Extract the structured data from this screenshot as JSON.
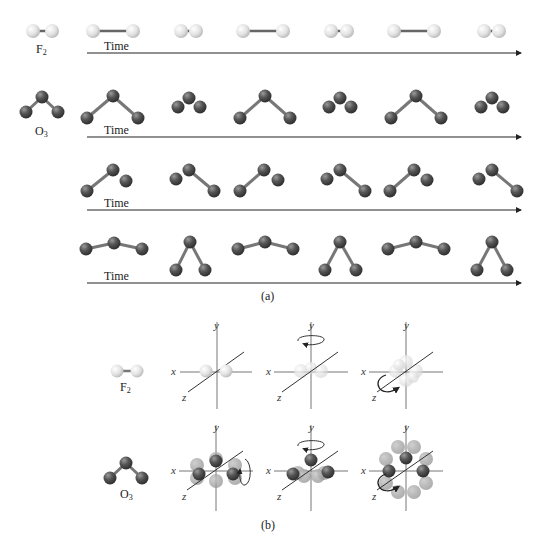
{
  "panel_a": {
    "caption": "(a)",
    "time_label": "Time",
    "rows": [
      {
        "id": "f2-vibration",
        "molecule": "F",
        "molecule_sub": "2",
        "atom_color": "light-gray",
        "frames": [
          "short",
          "long",
          "short",
          "long",
          "short",
          "long",
          "short"
        ]
      },
      {
        "id": "o3-mode-1",
        "molecule": "O",
        "molecule_sub": "3",
        "atom_color": "dark-gray",
        "frames": [
          "bent-wide",
          "compressed",
          "bent-wide",
          "compressed",
          "bent-wide",
          "compressed"
        ]
      },
      {
        "id": "o3-mode-2",
        "frames": [
          "asym-right-short",
          "asym-left-short",
          "asym-right-short",
          "asym-left-short",
          "asym-right-short",
          "asym-left-short"
        ]
      },
      {
        "id": "o3-mode-3",
        "frames": [
          "flat",
          "narrow",
          "flat",
          "narrow",
          "flat",
          "narrow"
        ]
      }
    ]
  },
  "panel_b": {
    "caption": "(b)",
    "axis_labels": {
      "x": "x",
      "y": "y",
      "z": "z"
    },
    "rows": [
      {
        "molecule": "F",
        "molecule_sub": "2",
        "views": [
          "translation-static",
          "rotation-about-y",
          "rotation-about-z"
        ]
      },
      {
        "molecule": "O",
        "molecule_sub": "3",
        "views": [
          "rotation-about-x",
          "rotation-about-y",
          "rotation-about-z"
        ]
      }
    ]
  },
  "colors": {
    "light_atom": "#e4e4e4",
    "dark_atom": "#4a4a4a",
    "bond": "#666666",
    "arrow": "#222222"
  }
}
